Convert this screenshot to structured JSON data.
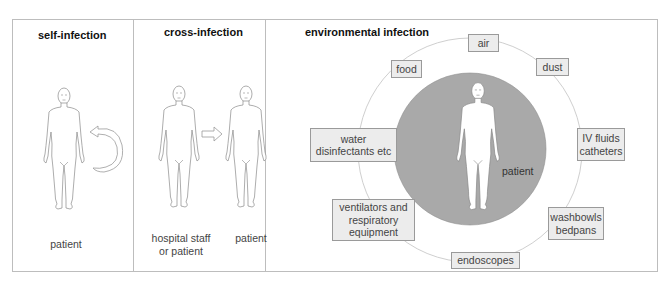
{
  "panels": {
    "self_infection": {
      "title": "self-infection",
      "figure_label": "patient"
    },
    "cross_infection": {
      "title": "cross-infection",
      "source_label": "hospital staff\nor patient",
      "source_label_line1": "hospital staff",
      "source_label_line2": "or patient",
      "target_label": "patient"
    },
    "environmental_infection": {
      "title": "environmental infection",
      "center_label": "patient",
      "sources": [
        {
          "id": "air",
          "line1": "air",
          "line2": ""
        },
        {
          "id": "food",
          "line1": "food",
          "line2": ""
        },
        {
          "id": "dust",
          "line1": "dust",
          "line2": ""
        },
        {
          "id": "water",
          "line1": "water",
          "line2": "disinfectants etc"
        },
        {
          "id": "iv",
          "line1": "IV fluids",
          "line2": "catheters"
        },
        {
          "id": "ventilators",
          "line1": "ventilators and",
          "line2": "respiratory",
          "line3": "equipment"
        },
        {
          "id": "washbowls",
          "line1": "washbowls",
          "line2": "bedpans"
        },
        {
          "id": "endoscopes",
          "line1": "endoscopes",
          "line2": ""
        }
      ]
    }
  },
  "colors": {
    "frame": "#bdbdbd",
    "box_fill": "#ececec",
    "box_border": "#9a9a9a",
    "center_circle": "#a9a9a9",
    "ring": "#cfcfcf",
    "figure_stroke": "#8a8a8a"
  }
}
